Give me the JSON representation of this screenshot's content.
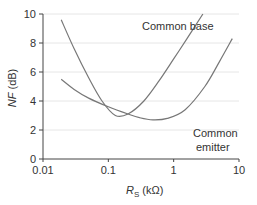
{
  "chart_data": {
    "type": "line",
    "title": "",
    "xlabel": "R_S (kΩ)",
    "xlabel_main": "R",
    "xlabel_sub": "S",
    "xlabel_unit": " (kΩ)",
    "ylabel": "NF (dB)",
    "ylabel_main": "NF",
    "ylabel_unit": " (dB)",
    "xscale": "log",
    "xlim": [
      0.01,
      10
    ],
    "ylim": [
      0,
      10
    ],
    "grid": "horizontal",
    "legend": "none (inline annotations)",
    "x_ticks": [
      "0.01",
      "0.1",
      "1",
      "10"
    ],
    "y_ticks": [
      "0",
      "2",
      "4",
      "6",
      "8",
      "10"
    ],
    "series": [
      {
        "name": "Common base",
        "x": [
          0.019,
          0.03,
          0.05,
          0.08,
          0.128,
          0.2,
          0.35,
          0.6,
          1.0,
          1.6,
          2.8
        ],
        "y": [
          9.6,
          7.6,
          5.6,
          4.0,
          3.0,
          3.1,
          4.0,
          5.4,
          6.9,
          8.3,
          10.0
        ]
      },
      {
        "name": "Common emitter",
        "x": [
          0.019,
          0.03,
          0.05,
          0.1,
          0.2,
          0.3,
          0.48,
          0.8,
          1.5,
          3.0,
          5.0,
          7.9
        ],
        "y": [
          5.5,
          4.8,
          4.2,
          3.6,
          3.1,
          2.85,
          2.7,
          2.8,
          3.4,
          5.0,
          6.7,
          8.3
        ]
      }
    ],
    "annotations": [
      {
        "text": "Common base",
        "near_series": "Common base"
      },
      {
        "text": "Common",
        "near_series": "Common emitter"
      },
      {
        "text": "emitter",
        "near_series": "Common emitter"
      }
    ]
  },
  "colors": {
    "curve": "#777777",
    "axis": "#444444",
    "grid": "#e6e6e6",
    "text": "#333333"
  }
}
